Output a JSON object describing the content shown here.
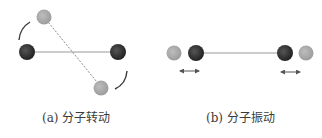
{
  "figure": {
    "panels": [
      {
        "id": "a",
        "caption": "(a) 分子转动",
        "description": "molecular rotation"
      },
      {
        "id": "b",
        "caption": "(b) 分子振动",
        "description": "molecular vibration"
      }
    ],
    "colors": {
      "atom_dark": "#2b2b2b",
      "atom_light": "#a6a6a6",
      "bond": "#9a9a9a",
      "bond_dashed": "#8a8a8a",
      "arrow": "#555555",
      "text": "#3a3a3a"
    }
  }
}
